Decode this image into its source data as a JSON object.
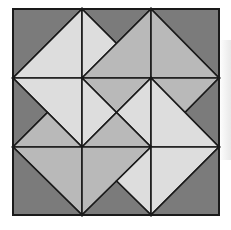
{
  "figure": {
    "frame": {
      "x": 13,
      "y": 9,
      "width": 206,
      "height": 206
    },
    "grid": {
      "cols": [
        13,
        82,
        151,
        219
      ],
      "rows": [
        9,
        78,
        147,
        215
      ]
    },
    "colors": {
      "dark": "#7b7b7b",
      "medium": "#b9b9b9",
      "light": "#dddddd",
      "stroke": "#1a1a1a",
      "background": "#ffffff"
    },
    "pieces": [
      {
        "cell": "r1c1",
        "tone": "dark",
        "points": "13,9 82,9 13,78"
      },
      {
        "cell": "r1c1",
        "tone": "light",
        "points": "82,9 82,78 13,78"
      },
      {
        "cell": "r1c2",
        "tone": "dark",
        "points": "82,9 151,9 116.5,43.5"
      },
      {
        "cell": "r1c2",
        "tone": "light",
        "points": "82,9 116.5,43.5 82,78"
      },
      {
        "cell": "r1c2",
        "tone": "medium",
        "points": "82,78 151,9 151,78"
      },
      {
        "cell": "r1c3",
        "tone": "dark",
        "points": "151,9 219,9 219,78"
      },
      {
        "cell": "r1c3",
        "tone": "medium",
        "points": "151,9 151,78 219,78"
      },
      {
        "cell": "r2c1",
        "tone": "light",
        "points": "13,78 82,78 82,147"
      },
      {
        "cell": "r2c1",
        "tone": "dark",
        "points": "13,78 47.5,112.5 13,147"
      },
      {
        "cell": "r2c1",
        "tone": "medium",
        "points": "13,147 47.5,112.5 82,147"
      },
      {
        "cell": "r2c2",
        "tone": "medium",
        "points": "82,78 151,78 116.5,112.5"
      },
      {
        "cell": "r2c2",
        "tone": "light",
        "points": "82,78 116.5,112.5 82,147"
      },
      {
        "cell": "r2c2",
        "tone": "light",
        "points": "151,78 151,147 116.5,112.5"
      },
      {
        "cell": "r2c2",
        "tone": "medium",
        "points": "82,147 116.5,112.5 151,147"
      },
      {
        "cell": "r2c3",
        "tone": "medium",
        "points": "151,78 219,78 185,112.5"
      },
      {
        "cell": "r2c3",
        "tone": "dark",
        "points": "219,78 185,112.5 219,147"
      },
      {
        "cell": "r2c3",
        "tone": "light",
        "points": "151,78 151,147 219,147"
      },
      {
        "cell": "r3c1",
        "tone": "medium",
        "points": "13,147 82,147 82,215"
      },
      {
        "cell": "r3c1",
        "tone": "dark",
        "points": "13,147 13,215 82,215"
      },
      {
        "cell": "r3c2",
        "tone": "medium",
        "points": "82,147 151,147 82,215"
      },
      {
        "cell": "r3c2",
        "tone": "light",
        "points": "151,147 151,215 116.5,181"
      },
      {
        "cell": "r3c2",
        "tone": "dark",
        "points": "82,215 151,215 116.5,181"
      },
      {
        "cell": "r3c3",
        "tone": "light",
        "points": "151,147 219,147 151,215"
      },
      {
        "cell": "r3c3",
        "tone": "dark",
        "points": "219,147 219,215 151,215"
      }
    ]
  }
}
